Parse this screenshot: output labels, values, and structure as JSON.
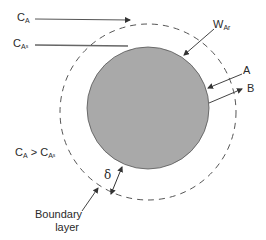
{
  "diagram": {
    "labels": {
      "bulk_conc": {
        "main": "C",
        "sub": "A"
      },
      "surface_conc": {
        "main": "C",
        "sub": "A",
        "subsub": "s"
      },
      "flux": {
        "main": "W",
        "sub": "Ar"
      },
      "species_a": "A",
      "species_b": "B",
      "condition": {
        "left_main": "C",
        "left_sub": "A",
        "op": " > ",
        "right_main": "C",
        "right_sub": "A",
        "right_subsub": "s"
      },
      "thickness": "δ",
      "boundary_layer": [
        "Boundary",
        "layer"
      ]
    },
    "colors": {
      "particle_fill": "#a9a9a9",
      "line": "#3a3a3a",
      "dashed": "#555555"
    }
  }
}
